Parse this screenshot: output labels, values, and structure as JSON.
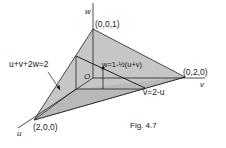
{
  "figure": {
    "caption": "Fig. 4.7",
    "axes": {
      "u": "u",
      "v": "v",
      "w": "w"
    },
    "origin_label": "O",
    "vertices": {
      "w_intercept": "(0,0,1)",
      "v_intercept": "(0,2,0)",
      "u_intercept": "(2,0,0)"
    },
    "plane_label": "u+v+2w=2",
    "surface_label": "w=1-½(u+v)",
    "trace_label": "v=2-u",
    "colors": {
      "plane_fill": "#c9c9c9",
      "plane_fill_dark": "#b5b5b5",
      "line": "#222222",
      "background": "#ffffff"
    }
  }
}
